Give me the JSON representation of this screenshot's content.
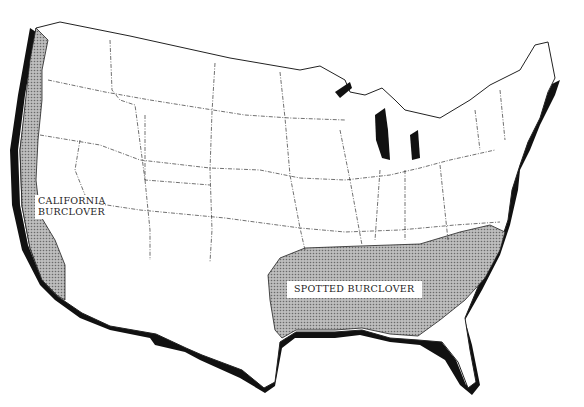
{
  "map": {
    "title": "Burclover distribution in the United States",
    "regions": [
      {
        "id": "california-burclover",
        "label_line1": "CALIFORNIA",
        "label_line2": "BURCLOVER",
        "area": "Pacific coast (Washington, Oregon, California)"
      },
      {
        "id": "spotted-burclover",
        "label": "SPOTTED BURCLOVER",
        "area": "Southeastern states (Texas east to the Carolinas)"
      }
    ],
    "colors": {
      "shading": "#a8a8a8",
      "coast_shadow": "#111111",
      "borders": "#333333",
      "background": "#ffffff"
    }
  }
}
